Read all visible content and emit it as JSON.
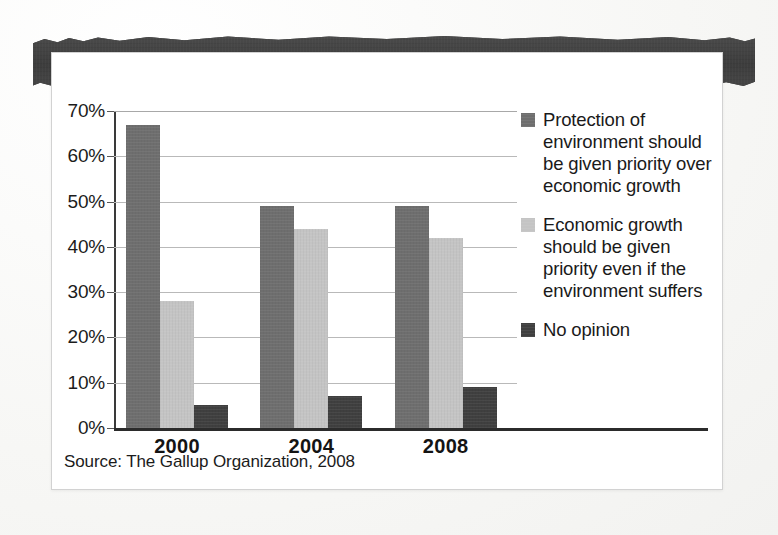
{
  "banner": {
    "title": "PUBLIC OPINION ON THE ENVIRONMENT"
  },
  "source": {
    "text": "Source: The Gallup Organization, 2008"
  },
  "colors": {
    "series_protection": "#6e6e6e",
    "series_economy": "#c4c4c4",
    "series_no_opinion": "#3f3f3f",
    "banner_bg": "#434343",
    "banner_text": "#ffffff",
    "gridline": "#b9b9b9",
    "axis": "#2b2b2b",
    "card_bg": "#ffffff",
    "card_border": "#d2d2d2",
    "text": "#1a1a1a"
  },
  "chart_data": {
    "type": "bar",
    "title": "PUBLIC OPINION ON THE ENVIRONMENT",
    "subtitle": "",
    "xlabel": "",
    "ylabel": "",
    "categories": [
      "2000",
      "2004",
      "2008"
    ],
    "series": [
      {
        "name": "Protection of environment should be given priority over economic growth",
        "color": "#6e6e6e",
        "values": [
          67,
          49,
          49
        ]
      },
      {
        "name": "Economic growth should be given priority even if the environment suffers",
        "color": "#c4c4c4",
        "values": [
          28,
          44,
          42
        ]
      },
      {
        "name": "No opinion",
        "color": "#3f3f3f",
        "values": [
          5,
          7,
          9
        ]
      }
    ],
    "ylim": [
      0,
      70
    ],
    "ytick_step": 10,
    "ytick_labels": [
      "0%",
      "10%",
      "20%",
      "30%",
      "40%",
      "50%",
      "60%",
      "70%"
    ],
    "ytick_values": [
      0,
      10,
      20,
      30,
      40,
      50,
      60,
      70
    ],
    "grid": true,
    "grid_axis": "y",
    "legend_position": "right",
    "value_suffix": "%",
    "source": "Source: The Gallup Organization, 2008"
  },
  "legend": {
    "items": [
      {
        "label": "Protection of environment should be given priority over economic growth",
        "color": "#6e6e6e"
      },
      {
        "label": "Economic growth should be given priority even if the environment suffers",
        "color": "#c4c4c4"
      },
      {
        "label": "No opinion",
        "color": "#3f3f3f"
      }
    ]
  }
}
